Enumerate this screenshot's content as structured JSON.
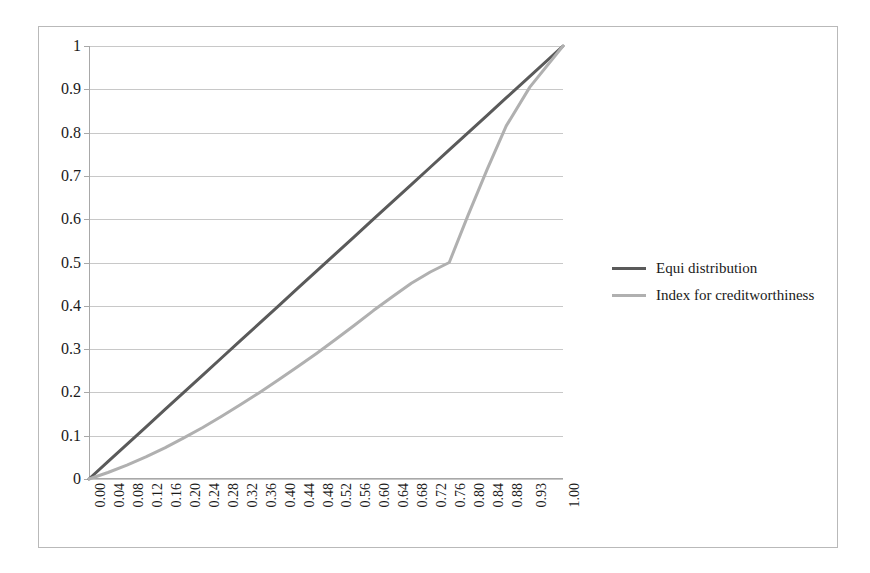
{
  "chart_data": {
    "type": "line",
    "title": "",
    "xlabel": "",
    "ylabel": "",
    "xlim": [
      0,
      1
    ],
    "ylim": [
      0,
      1
    ],
    "grid": true,
    "legend_position": "right",
    "categories": [
      "0.00",
      "0.04",
      "0.08",
      "0.12",
      "0.16",
      "0.20",
      "0.24",
      "0.28",
      "0.32",
      "0.36",
      "0.40",
      "0.44",
      "0.48",
      "0.52",
      "0.56",
      "0.60",
      "0.64",
      "0.68",
      "0.72",
      "0.76",
      "0.80",
      "0.84",
      "0.88",
      "0.93",
      "1.00"
    ],
    "x": [
      0.0,
      0.04,
      0.08,
      0.12,
      0.16,
      0.2,
      0.24,
      0.28,
      0.32,
      0.36,
      0.4,
      0.44,
      0.48,
      0.52,
      0.56,
      0.6,
      0.64,
      0.68,
      0.72,
      0.76,
      0.8,
      0.84,
      0.88,
      0.93,
      1.0
    ],
    "y_ticks": [
      "0",
      "0.1",
      "0.2",
      "0.3",
      "0.4",
      "0.5",
      "0.6",
      "0.7",
      "0.8",
      "0.9",
      "1"
    ],
    "y_tick_values": [
      0,
      0.1,
      0.2,
      0.3,
      0.4,
      0.5,
      0.6,
      0.7,
      0.8,
      0.9,
      1
    ],
    "series": [
      {
        "name": "Equi distribution",
        "color": "#5a5a5a",
        "width": 3,
        "values": [
          0.0,
          0.04,
          0.08,
          0.12,
          0.16,
          0.2,
          0.24,
          0.28,
          0.32,
          0.36,
          0.4,
          0.44,
          0.48,
          0.52,
          0.56,
          0.6,
          0.64,
          0.68,
          0.72,
          0.76,
          0.8,
          0.84,
          0.88,
          0.93,
          1.0
        ]
      },
      {
        "name": "Index for creditworthiness",
        "color": "#b0b0b0",
        "width": 3,
        "values": [
          0.0,
          0.015,
          0.032,
          0.051,
          0.072,
          0.095,
          0.119,
          0.145,
          0.172,
          0.2,
          0.229,
          0.259,
          0.29,
          0.322,
          0.355,
          0.389,
          0.421,
          0.452,
          0.478,
          0.5,
          0.61,
          0.715,
          0.815,
          0.905,
          1.0
        ]
      }
    ]
  },
  "legend": {
    "items": [
      {
        "label": "Equi distribution",
        "color": "#5a5a5a"
      },
      {
        "label": "Index for creditworthiness",
        "color": "#b0b0b0"
      }
    ]
  },
  "colors": {
    "equi_distribution": "#5a5a5a",
    "index_creditworthiness": "#b0b0b0",
    "gridline": "#c8c8c8",
    "axis": "#a8a8a8",
    "frame": "#b9b9b9",
    "text": "#1a1a1a"
  }
}
